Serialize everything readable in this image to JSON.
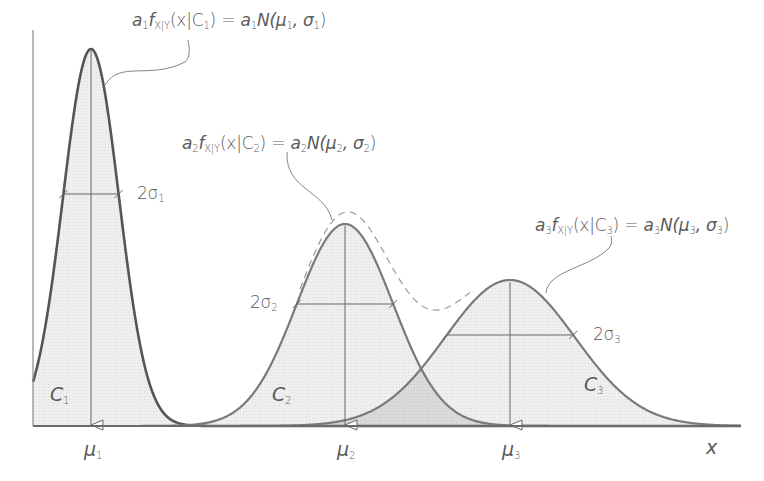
{
  "diagram": {
    "type": "gaussian-mixture",
    "axis": {
      "x_label": "x"
    },
    "components": [
      {
        "id": "C1",
        "class_label": "C",
        "class_sub": "1",
        "mean_label": "μ",
        "mean_sub": "1",
        "width_label": "2σ",
        "width_sub": "1",
        "formula": {
          "coef": "a",
          "coef_sub": "1",
          "f": "f",
          "f_sub": "X|Y",
          "arg": "(x|C",
          "arg_sub": "1",
          "arg_close": ")",
          "eq": " = ",
          "rhs_coef": "a",
          "rhs_coef_sub": "1",
          "rhs": "N(μ",
          "rhs_mu_sub": "1",
          "rhs_mid": ", σ",
          "rhs_sigma_sub": "1",
          "rhs_close": ")"
        },
        "geometry": {
          "mu_x": 91,
          "peak_y": 49,
          "sigma_px": 28
        }
      },
      {
        "id": "C2",
        "class_label": "C",
        "class_sub": "2",
        "mean_label": "μ",
        "mean_sub": "2",
        "width_label": "2σ",
        "width_sub": "2",
        "formula": {
          "coef": "a",
          "coef_sub": "2",
          "f": "f",
          "f_sub": "X|Y",
          "arg": "(x|C",
          "arg_sub": "2",
          "arg_close": ")",
          "eq": " = ",
          "rhs_coef": "a",
          "rhs_coef_sub": "2",
          "rhs": "N(μ",
          "rhs_mu_sub": "2",
          "rhs_mid": ", σ",
          "rhs_sigma_sub": "2",
          "rhs_close": ")"
        },
        "geometry": {
          "mu_x": 345,
          "peak_y": 224,
          "sigma_px": 48
        }
      },
      {
        "id": "C3",
        "class_label": "C",
        "class_sub": "3",
        "mean_label": "μ",
        "mean_sub": "3",
        "width_label": "2σ",
        "width_sub": "3",
        "formula": {
          "coef": "a",
          "coef_sub": "3",
          "f": "f",
          "f_sub": "X|Y",
          "arg": "(x|C",
          "arg_sub": "3",
          "arg_close": ")",
          "eq": " = ",
          "rhs_coef": "a",
          "rhs_coef_sub": "3",
          "rhs": "N(μ",
          "rhs_mu_sub": "3",
          "rhs_mid": ", σ",
          "rhs_sigma_sub": "3",
          "rhs_close": ")"
        },
        "geometry": {
          "mu_x": 510,
          "peak_y": 280,
          "sigma_px": 65
        }
      }
    ],
    "mixture_curve": {
      "style": "dashed",
      "label": "sum of weighted components"
    },
    "colors": {
      "curve": "#7a7a7a",
      "curve_dark": "#555555",
      "fill": "#ececec",
      "overlap_fill": "#d6d6d6",
      "axis": "#6a6a6a",
      "text": "#5a5a5a"
    }
  }
}
